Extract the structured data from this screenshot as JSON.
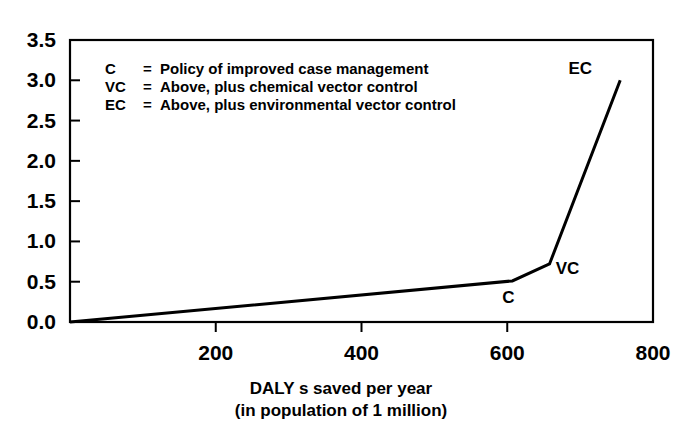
{
  "chart_data": {
    "type": "line",
    "title": "",
    "subtitle": "",
    "xlabel_line1": "DALY s saved per year",
    "xlabel_line2": "(in population of 1 million)",
    "ylabel": "",
    "xlim": [
      0,
      800
    ],
    "ylim": [
      0.0,
      3.5
    ],
    "grid": false,
    "legend_position": "inside-top-left",
    "x_ticks": [
      {
        "value": 200,
        "label": "200"
      },
      {
        "value": 400,
        "label": "400"
      },
      {
        "value": 600,
        "label": "600"
      },
      {
        "value": 800,
        "label": "800"
      }
    ],
    "y_ticks": [
      {
        "value": 0.0,
        "label": "0.0"
      },
      {
        "value": 0.5,
        "label": "0.5"
      },
      {
        "value": 1.0,
        "label": "1.0"
      },
      {
        "value": 1.5,
        "label": "1.5"
      },
      {
        "value": 2.0,
        "label": "2.0"
      },
      {
        "value": 2.5,
        "label": "2.5"
      },
      {
        "value": 3.0,
        "label": "3.0"
      },
      {
        "value": 3.5,
        "label": "3.5"
      }
    ],
    "series": [
      {
        "name": "Cost per DALY saved",
        "color": "#000000",
        "x": [
          0,
          607,
          658,
          755
        ],
        "y": [
          0.0,
          0.51,
          0.72,
          3.0
        ]
      }
    ],
    "point_annotations": [
      {
        "label": "C",
        "x": 607,
        "y": 0.51,
        "dx": -4,
        "dy": 22
      },
      {
        "label": "VC",
        "x": 658,
        "y": 0.72,
        "dx": 18,
        "dy": 10
      },
      {
        "label": "EC",
        "x": 755,
        "y": 3.0,
        "dx": -40,
        "dy": -6
      }
    ],
    "legend_entries": [
      {
        "key": "C",
        "sep": "=",
        "text": "Policy of improved case management"
      },
      {
        "key": "VC",
        "sep": "=",
        "text": "Above, plus chemical vector control"
      },
      {
        "key": "EC",
        "sep": "=",
        "text": "Above, plus environmental vector control"
      }
    ],
    "colors": {
      "line": "#000000",
      "axis": "#000000",
      "background": "#ffffff",
      "text": "#000000"
    }
  }
}
